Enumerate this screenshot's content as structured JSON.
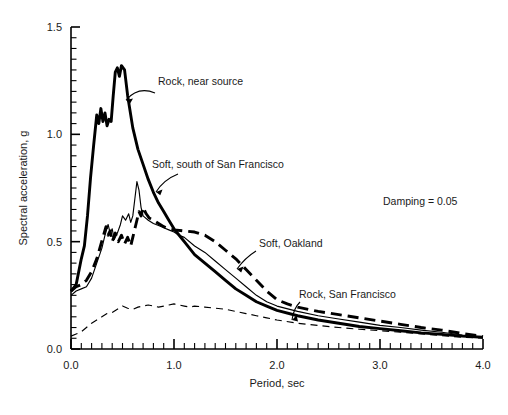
{
  "chart_data": {
    "type": "line",
    "title": "",
    "xlabel": "Period, sec",
    "ylabel": "Spectral acceleration, g",
    "xlim": [
      0.0,
      4.0
    ],
    "ylim": [
      0.0,
      1.5
    ],
    "grid": false,
    "legend_position": "inline-annotations",
    "xticks": [
      0.0,
      1.0,
      2.0,
      3.0,
      4.0
    ],
    "xtick_labels": [
      "0.0",
      "1.0",
      "2.0",
      "3.0",
      "4.0"
    ],
    "yticks": [
      0.0,
      0.5,
      1.0,
      1.5
    ],
    "ytick_labels": [
      "0.0",
      "0.5",
      "1.0",
      "1.5"
    ],
    "x_minor_tick_step": 0.1,
    "y_minor_tick_step": 0.05,
    "annotations": [
      {
        "name": "damping-note",
        "text": "Damping = 0.05",
        "x": 2.85,
        "y": 0.97
      }
    ],
    "series": [
      {
        "name": "Rock, near source",
        "style": "solid-thick",
        "label_x": 0.8,
        "label_y": 1.29,
        "points": [
          [
            0.0,
            0.27
          ],
          [
            0.05,
            0.3
          ],
          [
            0.1,
            0.42
          ],
          [
            0.13,
            0.48
          ],
          [
            0.16,
            0.62
          ],
          [
            0.19,
            0.8
          ],
          [
            0.22,
            0.95
          ],
          [
            0.25,
            1.09
          ],
          [
            0.27,
            1.05
          ],
          [
            0.29,
            1.12
          ],
          [
            0.31,
            1.06
          ],
          [
            0.33,
            1.1
          ],
          [
            0.35,
            1.04
          ],
          [
            0.37,
            1.07
          ],
          [
            0.39,
            1.06
          ],
          [
            0.41,
            1.18
          ],
          [
            0.43,
            1.29
          ],
          [
            0.45,
            1.31
          ],
          [
            0.47,
            1.27
          ],
          [
            0.49,
            1.32
          ],
          [
            0.52,
            1.3
          ],
          [
            0.55,
            1.18
          ],
          [
            0.6,
            1.03
          ],
          [
            0.65,
            0.93
          ],
          [
            0.7,
            0.86
          ],
          [
            0.75,
            0.79
          ],
          [
            0.8,
            0.73
          ],
          [
            0.85,
            0.68
          ],
          [
            0.9,
            0.64
          ],
          [
            0.95,
            0.6
          ],
          [
            1.0,
            0.56
          ],
          [
            1.05,
            0.53
          ],
          [
            1.1,
            0.5
          ],
          [
            1.2,
            0.44
          ],
          [
            1.3,
            0.4
          ],
          [
            1.4,
            0.36
          ],
          [
            1.5,
            0.32
          ],
          [
            1.6,
            0.28
          ],
          [
            1.7,
            0.25
          ],
          [
            1.8,
            0.22
          ],
          [
            1.9,
            0.2
          ],
          [
            2.0,
            0.18
          ],
          [
            2.2,
            0.155
          ],
          [
            2.4,
            0.135
          ],
          [
            2.6,
            0.12
          ],
          [
            2.8,
            0.105
          ],
          [
            3.0,
            0.095
          ],
          [
            3.2,
            0.085
          ],
          [
            3.4,
            0.075
          ],
          [
            3.6,
            0.068
          ],
          [
            3.8,
            0.06
          ],
          [
            4.0,
            0.055
          ]
        ]
      },
      {
        "name": "Soft, south of San Francisco",
        "style": "solid-thin",
        "label_x": 1.15,
        "label_y": 0.88,
        "points": [
          [
            0.0,
            0.25
          ],
          [
            0.05,
            0.27
          ],
          [
            0.1,
            0.28
          ],
          [
            0.15,
            0.29
          ],
          [
            0.2,
            0.33
          ],
          [
            0.25,
            0.4
          ],
          [
            0.3,
            0.47
          ],
          [
            0.33,
            0.53
          ],
          [
            0.36,
            0.58
          ],
          [
            0.38,
            0.54
          ],
          [
            0.4,
            0.56
          ],
          [
            0.42,
            0.51
          ],
          [
            0.45,
            0.54
          ],
          [
            0.48,
            0.58
          ],
          [
            0.5,
            0.62
          ],
          [
            0.53,
            0.6
          ],
          [
            0.56,
            0.63
          ],
          [
            0.58,
            0.59
          ],
          [
            0.6,
            0.62
          ],
          [
            0.62,
            0.7
          ],
          [
            0.64,
            0.78
          ],
          [
            0.66,
            0.74
          ],
          [
            0.68,
            0.66
          ],
          [
            0.7,
            0.62
          ],
          [
            0.75,
            0.6
          ],
          [
            0.8,
            0.585
          ],
          [
            0.85,
            0.575
          ],
          [
            0.9,
            0.565
          ],
          [
            0.95,
            0.555
          ],
          [
            1.0,
            0.545
          ],
          [
            1.05,
            0.53
          ],
          [
            1.1,
            0.52
          ],
          [
            1.2,
            0.48
          ],
          [
            1.3,
            0.45
          ],
          [
            1.4,
            0.41
          ],
          [
            1.5,
            0.37
          ],
          [
            1.6,
            0.33
          ],
          [
            1.7,
            0.29
          ],
          [
            1.8,
            0.25
          ],
          [
            1.9,
            0.22
          ],
          [
            2.0,
            0.2
          ],
          [
            2.2,
            0.175
          ],
          [
            2.4,
            0.155
          ],
          [
            2.6,
            0.14
          ],
          [
            2.8,
            0.125
          ],
          [
            3.0,
            0.11
          ],
          [
            3.2,
            0.1
          ],
          [
            3.4,
            0.088
          ],
          [
            3.6,
            0.078
          ],
          [
            3.8,
            0.065
          ],
          [
            4.0,
            0.055
          ]
        ]
      },
      {
        "name": "Soft, Oakland",
        "style": "dashed-thick",
        "label_x": 1.85,
        "label_y": 0.56,
        "points": [
          [
            0.0,
            0.27
          ],
          [
            0.05,
            0.29
          ],
          [
            0.1,
            0.3
          ],
          [
            0.15,
            0.32
          ],
          [
            0.2,
            0.36
          ],
          [
            0.25,
            0.42
          ],
          [
            0.28,
            0.47
          ],
          [
            0.31,
            0.52
          ],
          [
            0.34,
            0.57
          ],
          [
            0.36,
            0.53
          ],
          [
            0.38,
            0.55
          ],
          [
            0.4,
            0.5
          ],
          [
            0.43,
            0.54
          ],
          [
            0.46,
            0.5
          ],
          [
            0.49,
            0.53
          ],
          [
            0.52,
            0.49
          ],
          [
            0.55,
            0.52
          ],
          [
            0.58,
            0.48
          ],
          [
            0.6,
            0.52
          ],
          [
            0.63,
            0.58
          ],
          [
            0.66,
            0.64
          ],
          [
            0.68,
            0.62
          ],
          [
            0.7,
            0.66
          ],
          [
            0.73,
            0.63
          ],
          [
            0.76,
            0.61
          ],
          [
            0.8,
            0.6
          ],
          [
            0.85,
            0.585
          ],
          [
            0.9,
            0.57
          ],
          [
            0.95,
            0.56
          ],
          [
            1.0,
            0.555
          ],
          [
            1.1,
            0.55
          ],
          [
            1.2,
            0.545
          ],
          [
            1.3,
            0.53
          ],
          [
            1.4,
            0.5
          ],
          [
            1.5,
            0.46
          ],
          [
            1.6,
            0.42
          ],
          [
            1.7,
            0.37
          ],
          [
            1.8,
            0.32
          ],
          [
            1.9,
            0.27
          ],
          [
            2.0,
            0.23
          ],
          [
            2.1,
            0.21
          ],
          [
            2.2,
            0.195
          ],
          [
            2.4,
            0.175
          ],
          [
            2.6,
            0.16
          ],
          [
            2.8,
            0.145
          ],
          [
            3.0,
            0.13
          ],
          [
            3.2,
            0.115
          ],
          [
            3.4,
            0.1
          ],
          [
            3.6,
            0.088
          ],
          [
            3.8,
            0.072
          ],
          [
            4.0,
            0.058
          ]
        ]
      },
      {
        "name": "Rock, San Francisco",
        "style": "dashed-thin",
        "label_x": 2.42,
        "label_y": 0.255,
        "points": [
          [
            0.0,
            0.06
          ],
          [
            0.05,
            0.07
          ],
          [
            0.1,
            0.08
          ],
          [
            0.15,
            0.1
          ],
          [
            0.2,
            0.12
          ],
          [
            0.25,
            0.135
          ],
          [
            0.3,
            0.15
          ],
          [
            0.35,
            0.165
          ],
          [
            0.4,
            0.17
          ],
          [
            0.45,
            0.185
          ],
          [
            0.5,
            0.2
          ],
          [
            0.55,
            0.19
          ],
          [
            0.6,
            0.185
          ],
          [
            0.65,
            0.195
          ],
          [
            0.7,
            0.2
          ],
          [
            0.75,
            0.205
          ],
          [
            0.8,
            0.2
          ],
          [
            0.85,
            0.195
          ],
          [
            0.9,
            0.2
          ],
          [
            0.95,
            0.205
          ],
          [
            1.0,
            0.21
          ],
          [
            1.05,
            0.205
          ],
          [
            1.1,
            0.2
          ],
          [
            1.15,
            0.195
          ],
          [
            1.2,
            0.2
          ],
          [
            1.3,
            0.195
          ],
          [
            1.4,
            0.19
          ],
          [
            1.5,
            0.185
          ],
          [
            1.6,
            0.175
          ],
          [
            1.7,
            0.165
          ],
          [
            1.8,
            0.155
          ],
          [
            1.9,
            0.145
          ],
          [
            2.0,
            0.135
          ],
          [
            2.2,
            0.12
          ],
          [
            2.4,
            0.11
          ],
          [
            2.6,
            0.1
          ],
          [
            2.8,
            0.092
          ],
          [
            3.0,
            0.085
          ],
          [
            3.2,
            0.078
          ],
          [
            3.4,
            0.07
          ],
          [
            3.6,
            0.062
          ],
          [
            3.8,
            0.055
          ],
          [
            4.0,
            0.05
          ]
        ]
      }
    ]
  },
  "axes": {
    "x_title": "Period, sec",
    "y_title_main": "Spectral acceleration, ",
    "y_title_symbol": "g"
  },
  "labels": {
    "rock_near_source": "Rock, near source",
    "soft_south_sf": "Soft, south of San Francisco",
    "soft_oakland": "Soft, Oakland",
    "rock_sf": "Rock, San Francisco",
    "damping": "Damping = 0.05"
  },
  "xtick_labels": {
    "t0": "0.0",
    "t1": "1.0",
    "t2": "2.0",
    "t3": "3.0",
    "t4": "4.0"
  },
  "ytick_labels": {
    "y0": "0.0",
    "y1": "0.5",
    "y2": "1.0",
    "y3": "1.5"
  },
  "colors": {
    "line": "#000000",
    "text": "#1a1a1a",
    "background": "#ffffff"
  }
}
